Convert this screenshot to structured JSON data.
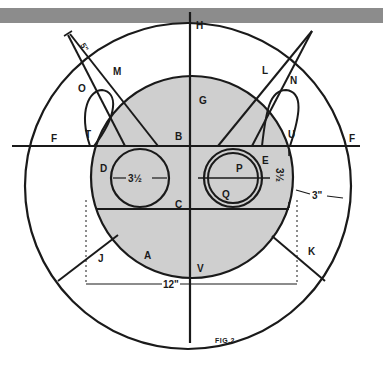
{
  "figure": {
    "caption": "FIG.2",
    "colors": {
      "background": "#ffffff",
      "shading": "#cfcfcf",
      "ink": "#1a1a1a",
      "top_bar": "#8c8c8c"
    }
  },
  "labels": {
    "H": "H",
    "G": "G",
    "B": "B",
    "C": "C",
    "D": "D",
    "E": "E",
    "F_left": "F",
    "F_right": "F",
    "T": "T",
    "U": "U",
    "M": "M",
    "N": "N",
    "O": "O",
    "L": "L",
    "P": "P",
    "Q": "Q",
    "A": "A",
    "V": "V",
    "J": "J",
    "K": "K"
  },
  "dimensions": {
    "left_circle_diameter": "3½",
    "right_circle_diameter": "3½",
    "ring_width": "3\"",
    "overall_width": "12\"",
    "arm_length": "5\""
  }
}
